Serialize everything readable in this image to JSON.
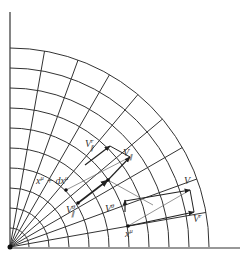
{
  "diagram": {
    "type": "polar-coordinate-grid",
    "grid": {
      "origin": [
        10,
        247
      ],
      "arc_radii": [
        19,
        39,
        59,
        79,
        99,
        119,
        139,
        159,
        179,
        199
      ],
      "ray_angles_deg": [
        10,
        20,
        30,
        40,
        50,
        60,
        70,
        80
      ],
      "line_color": "#333333"
    },
    "points": {
      "x_mu": [
        128,
        226
      ],
      "x_mu_plus_dx": [
        66,
        190
      ]
    },
    "labels": {
      "V": "V",
      "V_r": {
        "base": "V",
        "sup": "r"
      },
      "V_theta": {
        "base": "V",
        "sup": "θ"
      },
      "V_par": {
        "base": "V",
        "sub": "∥"
      },
      "V_par_r": {
        "base": "V",
        "sup": "r",
        "sub": "∥"
      },
      "V_par_theta": {
        "base": "V",
        "sup": "θ",
        "sub": "∥"
      },
      "x_mu": {
        "base": "x",
        "sup": "μ"
      },
      "x_mu_plus_dx": {
        "base": "x",
        "sup": "μ",
        "mid": " + d",
        "base2": "x",
        "sup2": "μ"
      }
    }
  }
}
